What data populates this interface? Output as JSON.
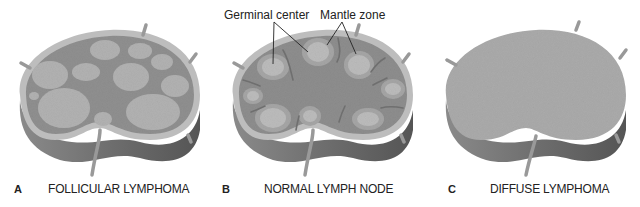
{
  "figure": {
    "panels": [
      {
        "letter": "A",
        "title": "FOLLICULAR LYMPHOMA"
      },
      {
        "letter": "B",
        "title": "NORMAL LYMPH NODE"
      },
      {
        "letter": "C",
        "title": "DIFFUSE LYMPHOMA"
      }
    ],
    "annotations": {
      "germinal_center": "Germinal center",
      "mantle_zone": "Mantle zone"
    },
    "colors": {
      "capsule": "#b9b9b9",
      "cortex": "#8f8f8f",
      "follicle": "#b5b5b5",
      "side": "#6d6d6d",
      "diffuse": "#a9a9a9"
    }
  }
}
